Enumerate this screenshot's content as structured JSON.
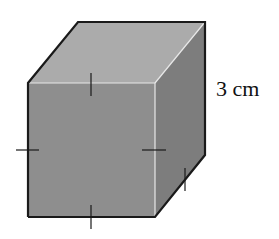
{
  "figure": {
    "shape": "cube",
    "edge_label": "3 cm",
    "equal_edge_tick_marks": 5,
    "colors": {
      "front_face": "#8c8c8c",
      "top_face": "#ababab",
      "right_face": "#7a7a7a",
      "edge": "#1a1a1a"
    }
  }
}
